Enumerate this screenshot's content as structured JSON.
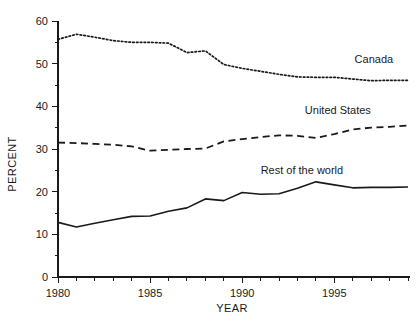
{
  "chart_data": {
    "type": "line",
    "title": "",
    "xlabel": "YEAR",
    "ylabel": "PERCENT",
    "xlim": [
      1980,
      1999
    ],
    "ylim": [
      0,
      60
    ],
    "yticks": [
      0,
      10,
      20,
      30,
      40,
      50,
      60
    ],
    "ytick_labels": [
      "0",
      "10",
      "20",
      "30",
      "40",
      "50",
      "60"
    ],
    "yminor_step": 5,
    "xticks": [
      1980,
      1985,
      1990,
      1995
    ],
    "xtick_labels": [
      "1980",
      "1985",
      "1990",
      "1995"
    ],
    "xminor_step": 1,
    "grid": false,
    "legend_position": "inline-right",
    "x": [
      1980,
      1981,
      1982,
      1983,
      1984,
      1985,
      1986,
      1987,
      1988,
      1989,
      1990,
      1991,
      1992,
      1993,
      1994,
      1995,
      1996,
      1997,
      1998,
      1999
    ],
    "series": [
      {
        "name": "Canada",
        "style": "dotted",
        "label": "Canada",
        "label_x": 1996.1,
        "label_y": 50.2,
        "values": [
          55.7,
          56.9,
          56.2,
          55.4,
          55.0,
          55.0,
          54.8,
          52.6,
          53.0,
          49.8,
          48.9,
          48.2,
          47.5,
          46.9,
          46.8,
          46.8,
          46.4,
          46.0,
          46.1,
          46.1
        ]
      },
      {
        "name": "United States",
        "style": "dashed",
        "label": "United States",
        "label_x": 1993.4,
        "label_y": 38.3,
        "values": [
          31.5,
          31.4,
          31.2,
          31.0,
          30.6,
          29.6,
          29.8,
          30.0,
          30.1,
          31.8,
          32.3,
          32.8,
          33.2,
          33.1,
          32.6,
          33.5,
          34.6,
          35.0,
          35.2,
          35.5
        ]
      },
      {
        "name": "Rest of the world",
        "style": "solid",
        "label": "Rest of the world",
        "label_x": 1991.0,
        "label_y": 24.2,
        "values": [
          12.8,
          11.7,
          12.6,
          13.4,
          14.2,
          14.3,
          15.4,
          16.2,
          18.3,
          17.9,
          19.8,
          19.4,
          19.5,
          20.8,
          22.3,
          21.6,
          20.9,
          21.0,
          21.0,
          21.1
        ]
      }
    ]
  },
  "axes": {
    "ylabel_text": "PERCENT",
    "xlabel_text": "YEAR"
  }
}
